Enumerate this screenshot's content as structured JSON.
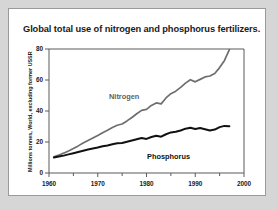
{
  "chart_data": {
    "type": "line",
    "title": "Global total use of nitrogen and phosphorus fertilizers.",
    "xlabel": "",
    "ylabel": "Millions tonnes, World, excluding former USSR",
    "xlim": [
      1960,
      2000
    ],
    "ylim": [
      0,
      80
    ],
    "x_ticks": [
      1960,
      1970,
      1980,
      1990,
      2000
    ],
    "x_tick_labels": [
      "1960",
      "1970",
      "1980",
      "1990",
      "2000"
    ],
    "x_minor_ticks": [
      1965,
      1975,
      1985,
      1995
    ],
    "y_ticks": [
      0,
      20,
      40,
      60,
      80
    ],
    "y_tick_labels": [
      "0",
      "20",
      "40",
      "60",
      "80"
    ],
    "grid": false,
    "legend": "inline-labels",
    "series": [
      {
        "name": "Nitrogen",
        "color": "#6e6e6e",
        "label_position": "above-left-of-line",
        "x": [
          1961,
          1962,
          1963,
          1964,
          1965,
          1966,
          1967,
          1968,
          1969,
          1970,
          1971,
          1972,
          1973,
          1974,
          1975,
          1976,
          1977,
          1978,
          1979,
          1980,
          1981,
          1982,
          1983,
          1984,
          1985,
          1986,
          1987,
          1988,
          1989,
          1990,
          1991,
          1992,
          1993,
          1994,
          1995,
          1996,
          1997
        ],
        "values": [
          10.5,
          11.5,
          12.8,
          14.2,
          15.8,
          17.5,
          19.3,
          21.0,
          22.6,
          24.2,
          26.0,
          27.6,
          29.4,
          30.8,
          31.6,
          33.6,
          35.8,
          38.2,
          40.4,
          41.0,
          43.6,
          45.2,
          44.6,
          48.4,
          51.2,
          52.8,
          55.2,
          58.0,
          60.2,
          58.8,
          60.4,
          62.0,
          62.6,
          64.2,
          68.0,
          72.6,
          79.6
        ]
      },
      {
        "name": "Phosphorus",
        "color": "#111111",
        "label_position": "below-right-of-line",
        "x": [
          1961,
          1962,
          1963,
          1964,
          1965,
          1966,
          1967,
          1968,
          1969,
          1970,
          1971,
          1972,
          1973,
          1974,
          1975,
          1976,
          1977,
          1978,
          1979,
          1980,
          1981,
          1982,
          1983,
          1984,
          1985,
          1986,
          1987,
          1988,
          1989,
          1990,
          1991,
          1992,
          1993,
          1994,
          1995,
          1996,
          1997
        ],
        "values": [
          10.0,
          10.6,
          11.2,
          12.0,
          12.8,
          13.6,
          14.4,
          15.2,
          15.8,
          16.4,
          17.2,
          17.8,
          18.6,
          19.2,
          19.4,
          20.2,
          21.0,
          21.8,
          22.6,
          22.0,
          23.2,
          24.0,
          23.4,
          25.0,
          26.2,
          26.6,
          27.4,
          28.6,
          29.2,
          28.4,
          29.0,
          28.2,
          27.4,
          28.0,
          29.6,
          30.4,
          30.2
        ]
      }
    ]
  }
}
